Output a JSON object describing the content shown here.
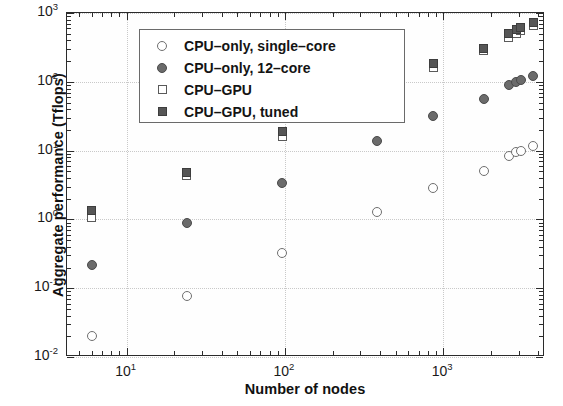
{
  "chart_data": {
    "type": "scatter",
    "title": "",
    "xlabel": "Number of nodes",
    "ylabel": "Aggregate performance (Tflops)",
    "xscale": "log",
    "yscale": "log",
    "xlim": [
      4.2,
      4400
    ],
    "ylim": [
      0.01,
      1000
    ],
    "grid": true,
    "legend_position": "top-left",
    "x_tick_labels": [
      "10",
      "10",
      "10"
    ],
    "x_tick_exponents": [
      "1",
      "2",
      "3"
    ],
    "x_tick_values": [
      10,
      100,
      1000
    ],
    "y_tick_labels": [
      "10",
      "10",
      "10",
      "10",
      "10",
      "10"
    ],
    "y_tick_exponents": [
      "3",
      "2",
      "1",
      "0",
      "-1",
      "-2"
    ],
    "y_tick_values": [
      1000,
      100,
      10,
      1,
      0.1,
      0.01
    ],
    "series": [
      {
        "name": "CPU-only, single-core",
        "marker": "circle-open",
        "x": [
          6,
          24,
          96,
          384,
          864,
          1800,
          2600,
          2900,
          3100,
          3700
        ],
        "y": [
          0.02,
          0.078,
          0.32,
          1.3,
          2.9,
          5.1,
          8.3,
          9.5,
          10.0,
          11.5
        ]
      },
      {
        "name": "CPU-only, 12-core",
        "marker": "circle-filled",
        "x": [
          6,
          24,
          96,
          384,
          864,
          1800,
          2600,
          2900,
          3100,
          3700
        ],
        "y": [
          0.22,
          0.9,
          3.4,
          14,
          32,
          57,
          90,
          100,
          105,
          123
        ]
      },
      {
        "name": "CPU-GPU",
        "marker": "square-open",
        "x": [
          6,
          24,
          96,
          384,
          864,
          1800,
          2600,
          2900,
          3100,
          3700
        ],
        "y": [
          1.05,
          4.3,
          16,
          70,
          160,
          290,
          440,
          510,
          560,
          660
        ]
      },
      {
        "name": "CPU-GPU, tuned",
        "marker": "square-filled",
        "x": [
          6,
          24,
          96,
          384,
          864,
          1800,
          2600,
          2900,
          3100,
          3700
        ],
        "y": [
          1.35,
          4.8,
          19,
          83,
          185,
          310,
          500,
          580,
          620,
          730
        ]
      }
    ]
  },
  "legend": {
    "entries": [
      {
        "label": "CPU–only, single–core",
        "marker": "circle-open"
      },
      {
        "label": "CPU–only, 12–core",
        "marker": "circle-filled"
      },
      {
        "label": "CPU–GPU",
        "marker": "square-open"
      },
      {
        "label": "CPU–GPU, tuned",
        "marker": "square-filled"
      }
    ]
  },
  "colors": {
    "axis": "#2b2b2b",
    "grid": "#c9c9c9",
    "marker_open": "#ffffff",
    "marker_filled": "#5d5d5d",
    "text": "#141414",
    "background": "#ffffff"
  }
}
